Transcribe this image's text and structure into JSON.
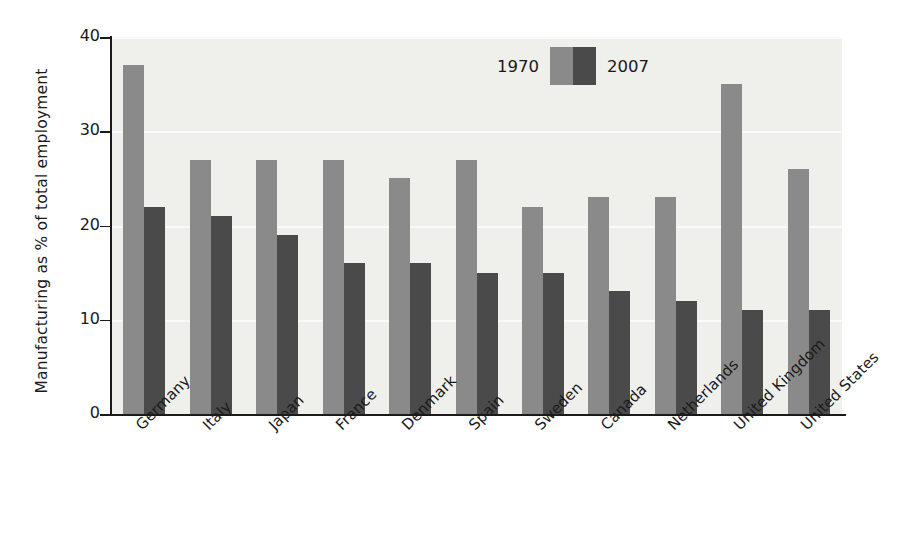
{
  "chart_data": {
    "type": "bar",
    "title": "",
    "xlabel": "",
    "ylabel": "Manufacturing as % of total employment",
    "ylim": [
      0,
      40
    ],
    "yticks": [
      0,
      10,
      20,
      30,
      40
    ],
    "grid": true,
    "legend_position": "top-right-inside",
    "categories": [
      "Germany",
      "Italy",
      "Japan",
      "France",
      "Denmark",
      "Spain",
      "Sweden",
      "Canada",
      "Netherlands",
      "United Kingdom",
      "United States"
    ],
    "series": [
      {
        "name": "1970",
        "color": "#8a8a8a",
        "values": [
          37,
          27,
          27,
          27,
          25,
          27,
          22,
          23,
          23,
          35,
          26
        ]
      },
      {
        "name": "2007",
        "color": "#4a4a4a",
        "values": [
          22,
          21,
          19,
          16,
          16,
          15,
          15,
          13,
          12,
          11,
          11
        ]
      }
    ]
  },
  "legend": {
    "label_1970": "1970",
    "label_2007": "2007"
  },
  "colors": {
    "series_1970": "#8a8a8a",
    "series_2007": "#4a4a4a",
    "plot_background": "#efefec",
    "gridline": "#fafaf8",
    "axis": "#1a1a1a",
    "page_background": "#ffffff"
  }
}
